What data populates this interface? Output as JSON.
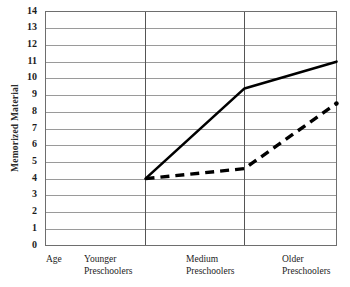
{
  "chart_data": {
    "type": "line",
    "title": "",
    "xlabel": "Age",
    "ylabel": "Memorized Material",
    "ylim": [
      0,
      14
    ],
    "ytick_step": 1,
    "grid": true,
    "legend": "none",
    "categories": [
      "Younger Preschoolers",
      "Medium Preschoolers",
      "Older Preschoolers"
    ],
    "category_axis_label": "Age",
    "ytick_labels": [
      "14",
      "13",
      "12",
      "11",
      "10",
      "9",
      "8",
      "7",
      "6",
      "5",
      "4",
      "3",
      "2",
      "1",
      "0"
    ],
    "series": [
      {
        "name": "solid-line",
        "style": "solid",
        "color": "#000000",
        "values": [
          4.0,
          9.4,
          11.0
        ]
      },
      {
        "name": "dashed-line",
        "style": "dashed",
        "color": "#000000",
        "values": [
          4.0,
          4.6,
          8.5
        ]
      }
    ]
  },
  "axis": {
    "y_title": "Memorized  Material",
    "ticks": [
      {
        "label": "14",
        "value": 14
      },
      {
        "label": "13",
        "value": 13
      },
      {
        "label": "12",
        "value": 12
      },
      {
        "label": "11",
        "value": 11
      },
      {
        "label": "10",
        "value": 10
      },
      {
        "label": "9",
        "value": 9
      },
      {
        "label": "8",
        "value": 8
      },
      {
        "label": "7",
        "value": 7
      },
      {
        "label": "6",
        "value": 6
      },
      {
        "label": "5",
        "value": 5
      },
      {
        "label": "4",
        "value": 4
      },
      {
        "label": "3",
        "value": 3
      },
      {
        "label": "2",
        "value": 2
      },
      {
        "label": "1",
        "value": 1
      },
      {
        "label": "0",
        "value": 0
      }
    ]
  },
  "x_labels": {
    "age": {
      "line1": "Age",
      "line2": ""
    },
    "younger": {
      "line1": "Younger",
      "line2": "Preschoolers"
    },
    "medium": {
      "line1": "Medium",
      "line2": "Preschoolers"
    },
    "older": {
      "line1": "Older",
      "line2": "Preschoolers"
    }
  },
  "colors": {
    "grid": "#9a9a9a",
    "frame": "#6e6e6e",
    "divider": "#555555",
    "series": "#000000",
    "background": "#ffffff"
  }
}
